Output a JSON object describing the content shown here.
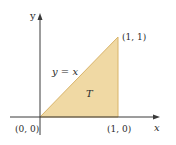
{
  "diagram": {
    "type": "region-plot",
    "region_label": "T",
    "curve_label": "y = x",
    "axes": {
      "x_label": "x",
      "y_label": "y"
    },
    "points": [
      {
        "label": "(0, 0)"
      },
      {
        "label": "(1, 0)"
      },
      {
        "label": "(1, 1)"
      }
    ],
    "colors": {
      "fill": "#f0d9a4",
      "edge": "#d9b46a",
      "axis": "#3a3a3a",
      "text": "#2a2a2a"
    }
  }
}
